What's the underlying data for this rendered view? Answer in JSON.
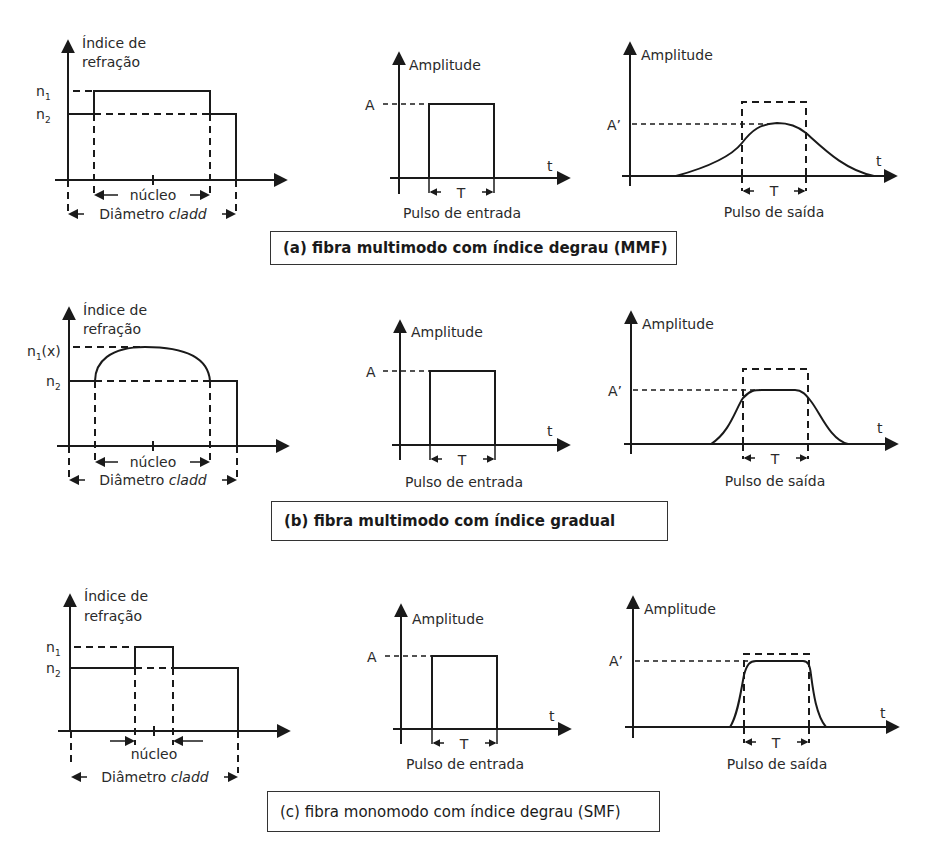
{
  "panels": [
    {
      "id": "a",
      "caption": "(a) fibra multimodo com índice degrau (MMF)",
      "profile": {
        "y_axis_label_line1": "Índice de",
        "y_axis_label_line2": "refração",
        "level_high": "n",
        "level_high_sub": "1",
        "level_high_suffix": "",
        "level_low": "n",
        "level_low_sub": "2",
        "core_label": "núcleo",
        "cladding_label_prefix": "Diâmetro ",
        "cladding_label_italic": "cladd",
        "shape": "step"
      },
      "input_pulse": {
        "y_label": "Amplitude",
        "amplitude_label": "A",
        "x_label": "t",
        "width_label": "T",
        "caption": "Pulso de entrada"
      },
      "output_pulse": {
        "y_label": "Amplitude",
        "amplitude_label": "A’",
        "x_label": "t",
        "width_label": "T",
        "caption": "Pulso de saída",
        "shape": "broad-bell"
      }
    },
    {
      "id": "b",
      "caption": "(b) fibra multimodo com índice gradual",
      "profile": {
        "y_axis_label_line1": "Índice de",
        "y_axis_label_line2": "refração",
        "level_high": "n",
        "level_high_sub": "1",
        "level_high_suffix": "(x)",
        "level_low": "n",
        "level_low_sub": "2",
        "core_label": "núcleo",
        "cladding_label_prefix": "Diâmetro ",
        "cladding_label_italic": "cladd",
        "shape": "graded"
      },
      "input_pulse": {
        "y_label": "Amplitude",
        "amplitude_label": "A",
        "x_label": "t",
        "width_label": "T",
        "caption": "Pulso de entrada"
      },
      "output_pulse": {
        "y_label": "Amplitude",
        "amplitude_label": "A’",
        "x_label": "t",
        "width_label": "T",
        "caption": "Pulso de saída",
        "shape": "flat-top-moderate"
      }
    },
    {
      "id": "c",
      "caption": "(c) fibra monomodo com índice degrau (SMF)",
      "profile": {
        "y_axis_label_line1": "Índice de",
        "y_axis_label_line2": "refração",
        "level_high": "n",
        "level_high_sub": "1",
        "level_high_suffix": "",
        "level_low": "n",
        "level_low_sub": "2",
        "core_label": "núcleo",
        "cladding_label_prefix": "Diâmetro ",
        "cladding_label_italic": "cladd",
        "shape": "narrow-step"
      },
      "input_pulse": {
        "y_label": "Amplitude",
        "amplitude_label": "A",
        "x_label": "t",
        "width_label": "T",
        "caption": "Pulso de entrada"
      },
      "output_pulse": {
        "y_label": "Amplitude",
        "amplitude_label": "A’",
        "x_label": "t",
        "width_label": "T",
        "caption": "Pulso de saída",
        "shape": "near-rectangular"
      }
    }
  ]
}
